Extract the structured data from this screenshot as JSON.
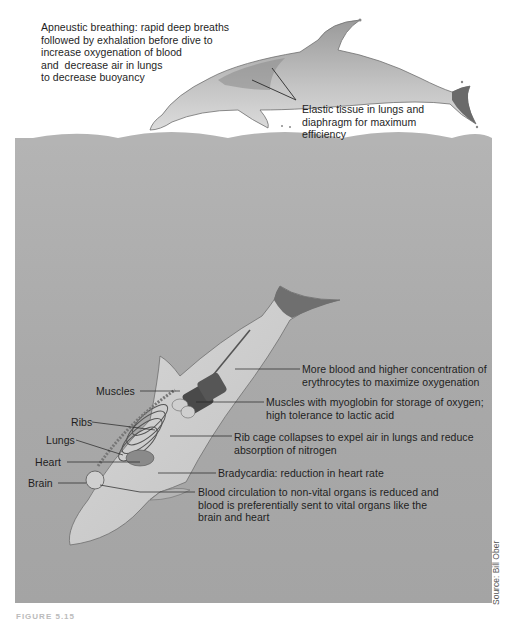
{
  "figure": {
    "caption_cutoff": "FIGURE 5.15",
    "source": "Source: Bill Ober",
    "colors": {
      "water": "#aaaaaa",
      "sky": "#ffffff",
      "dolphin_body": "#c8c8c8",
      "dolphin_dark": "#7d7d7d",
      "muscle": "#4a4a4a",
      "text": "#1e1e1e"
    }
  },
  "surface_dolphin": {
    "breathing_note": "Apneustic breathing: rapid deep breaths\nfollowed by exhalation before dive to\nincrease oxygenation of blood\nand  decrease air in lungs\nto decrease buoyancy",
    "elastic_note": "Elastic tissue in lungs and\ndiaphragm for maximum\nefficiency"
  },
  "diving_dolphin": {
    "left_labels": {
      "muscles": "Muscles",
      "ribs": "Ribs",
      "lungs": "Lungs",
      "heart": "Heart",
      "brain": "Brain"
    },
    "right_notes": {
      "blood": "More blood and higher concentration of\nerythrocytes to maximize oxygenation",
      "myoglobin": "Muscles with myoglobin for storage of oxygen;\nhigh tolerance to lactic acid",
      "rib_cage": "Rib cage collapses to expel air in lungs and reduce\nabsorption of nitrogen",
      "bradycardia": "Bradycardia: reduction in heart rate",
      "circulation": "Blood circulation to non-vital organs is reduced and\nblood is preferentially sent to vital organs like the\nbrain and heart"
    }
  }
}
